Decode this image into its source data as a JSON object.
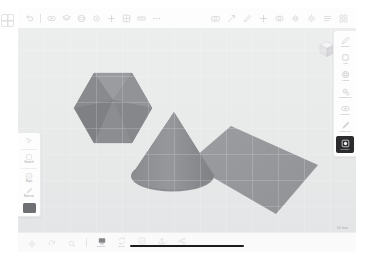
{
  "app": {
    "name": "Shapr3D",
    "document_title": "Untitled",
    "scale_readout": "10 mm"
  },
  "top_toolbar": {
    "left_items": [
      {
        "label": "Undo",
        "icon": "undo-icon"
      },
      {
        "label": "Redo",
        "icon": "redo-icon"
      },
      {
        "label": "Visibility",
        "icon": "eye-icon"
      },
      {
        "label": "Items",
        "icon": "layers-icon"
      },
      {
        "label": "Materials",
        "icon": "sphere-icon"
      },
      {
        "label": "Section",
        "icon": "dot-icon"
      },
      {
        "label": "Grid",
        "icon": "grid-icon"
      },
      {
        "label": "Measure",
        "icon": "ruler-icon"
      },
      {
        "label": "More",
        "icon": "ellipsis-icon"
      }
    ],
    "right_items": [
      {
        "label": "Camera",
        "icon": "camera-icon"
      },
      {
        "label": "Transform",
        "icon": "move-icon"
      },
      {
        "label": "Edit",
        "icon": "pencil-icon"
      },
      {
        "label": "Add",
        "icon": "plus-icon"
      },
      {
        "label": "Boolean",
        "icon": "union-icon"
      },
      {
        "label": "Mirror",
        "icon": "mirror-icon"
      },
      {
        "label": "Settings",
        "icon": "gear-icon"
      },
      {
        "label": "List",
        "icon": "list-icon"
      },
      {
        "label": "Grid View",
        "icon": "grid-view-icon"
      }
    ]
  },
  "left_palette": {
    "items": [
      {
        "label": "",
        "icon": "cursor-icon"
      },
      {
        "label": "Smooth",
        "icon": "square-outline-icon"
      },
      {
        "label": "Maps",
        "icon": "frame-icon"
      },
      {
        "label": "Material",
        "icon": "brush-icon"
      }
    ],
    "color_swatch": "#6f7073"
  },
  "right_rail": {
    "items": [
      {
        "label": "Sketch",
        "icon": "pencil-icon",
        "selected": false
      },
      {
        "label": "Add",
        "icon": "cube-icon",
        "selected": false
      },
      {
        "label": "Adjust",
        "icon": "sphere-icon",
        "selected": false
      },
      {
        "label": "Transform",
        "icon": "gears-icon",
        "selected": false
      },
      {
        "label": "Visibility",
        "icon": "eye-icon",
        "selected": false
      },
      {
        "label": "Materials",
        "icon": "brush-icon",
        "selected": false
      },
      {
        "label": "Render",
        "icon": "render-icon",
        "selected": true
      }
    ]
  },
  "bottom_bar": {
    "items": [
      {
        "label": "",
        "icon": "pan-icon",
        "active": false
      },
      {
        "label": "",
        "icon": "rotate-icon",
        "active": false
      },
      {
        "label": "",
        "icon": "zoom-icon",
        "active": false
      },
      {
        "label": "Display",
        "icon": "display-icon",
        "active": true
      },
      {
        "label": "Sync",
        "icon": "sync-icon",
        "active": false
      },
      {
        "label": "Finish",
        "icon": "check-icon",
        "active": false
      },
      {
        "label": "Export",
        "icon": "export-icon",
        "active": false
      },
      {
        "label": "Share",
        "icon": "share-icon",
        "active": false
      }
    ]
  },
  "canvas": {
    "background_color": "#e9eaea",
    "objects": [
      {
        "name": "icosahedron",
        "type": "polyhedron",
        "fill": "#8b8d90"
      },
      {
        "name": "cone",
        "type": "cone",
        "fill": "#8b8d90"
      },
      {
        "name": "plane",
        "type": "plane",
        "fill": "#97999c"
      }
    ],
    "view_cube_label": "view-cube"
  }
}
